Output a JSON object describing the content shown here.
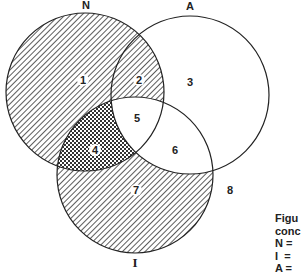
{
  "diagram": {
    "type": "venn",
    "sets": [
      {
        "id": "N",
        "label": "N",
        "cx": 85,
        "cy": 92,
        "r": 79,
        "hatch": "diagonal"
      },
      {
        "id": "A",
        "label": "A",
        "cx": 190,
        "cy": 95,
        "r": 79,
        "hatch": "none"
      },
      {
        "id": "I",
        "label": "I",
        "cx": 135,
        "cy": 175,
        "r": 78,
        "hatch": "diagonal"
      }
    ],
    "regions": [
      {
        "num": "1",
        "sets": [
          "N"
        ],
        "x": 83,
        "y": 84
      },
      {
        "num": "2",
        "sets": [
          "N",
          "A"
        ],
        "x": 139,
        "y": 84
      },
      {
        "num": "3",
        "sets": [
          "A"
        ],
        "x": 190,
        "y": 86
      },
      {
        "num": "4",
        "sets": [
          "N",
          "I"
        ],
        "x": 95,
        "y": 154
      },
      {
        "num": "5",
        "sets": [
          "N",
          "A",
          "I"
        ],
        "x": 137,
        "y": 122
      },
      {
        "num": "6",
        "sets": [
          "A",
          "I"
        ],
        "x": 175,
        "y": 154
      },
      {
        "num": "7",
        "sets": [
          "I"
        ],
        "x": 136,
        "y": 194
      },
      {
        "num": "8",
        "sets": [],
        "x": 230,
        "y": 194
      }
    ],
    "colors": {
      "stroke": "#222222",
      "hatch": "#333333",
      "background": "#ffffff"
    }
  },
  "caption": {
    "lines": [
      "Figu",
      "conc",
      "N =",
      "I  =",
      "A ="
    ]
  }
}
